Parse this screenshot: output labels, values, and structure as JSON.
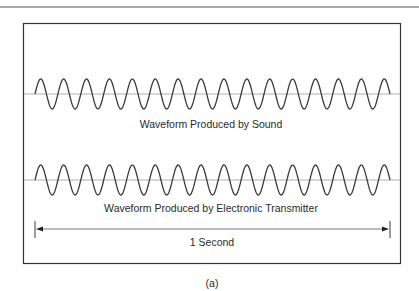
{
  "figure": {
    "caption": "(a)",
    "waveforms": [
      {
        "label": "Waveform Produced by Sound",
        "baseline_y": 94,
        "amplitude": 15,
        "cycles": 15.5,
        "x_start": 35,
        "x_end": 390
      },
      {
        "label": "Waveform Produced by Electronic Transmitter",
        "baseline_y": 180,
        "amplitude": 15,
        "cycles": 15.5,
        "x_start": 35,
        "x_end": 390
      }
    ],
    "duration_label": "1 Second",
    "colors": {
      "line": "#3a3a3a",
      "baseline": "#9a9a9a",
      "frame": "#333333",
      "text": "#2a2a2a"
    }
  }
}
